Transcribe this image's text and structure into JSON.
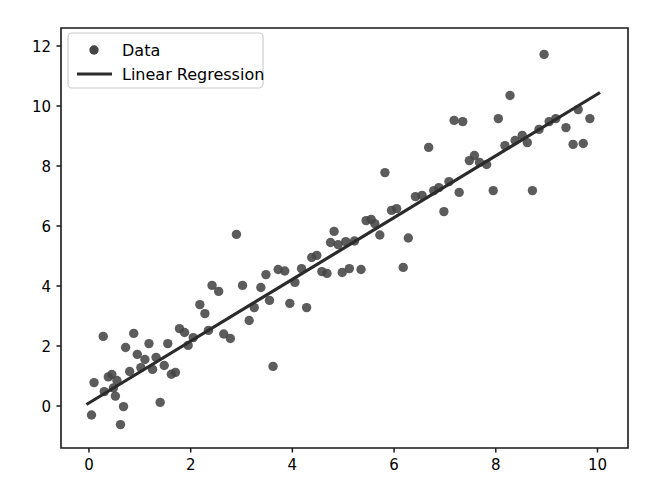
{
  "figure": {
    "width": 646,
    "height": 503,
    "background_color": "#ffffff"
  },
  "chart_data": {
    "type": "scatter",
    "title": "",
    "xlabel": "",
    "ylabel": "",
    "xlim": [
      -0.55,
      10.6
    ],
    "ylim": [
      -1.4,
      12.6
    ],
    "xticks": [
      0,
      2,
      4,
      6,
      8,
      10
    ],
    "yticks": [
      0,
      2,
      4,
      6,
      8,
      10,
      12
    ],
    "xtick_labels": [
      "0",
      "2",
      "4",
      "6",
      "8",
      "10"
    ],
    "ytick_labels": [
      "0",
      "2",
      "4",
      "6",
      "8",
      "10",
      "12"
    ],
    "grid": false,
    "legend_position": "upper left",
    "marker_color": "#454545",
    "line_color": "#2b2b2b",
    "marker_size": 9,
    "line_width": 3.2,
    "series": [
      {
        "name": "Data",
        "type": "scatter",
        "marker": "circle",
        "color": "#454545",
        "points": [
          [
            0.05,
            -0.3
          ],
          [
            0.1,
            0.78
          ],
          [
            0.28,
            2.32
          ],
          [
            0.3,
            0.48
          ],
          [
            0.38,
            0.97
          ],
          [
            0.45,
            1.05
          ],
          [
            0.48,
            0.6
          ],
          [
            0.52,
            0.33
          ],
          [
            0.55,
            0.85
          ],
          [
            0.62,
            -0.62
          ],
          [
            0.68,
            -0.02
          ],
          [
            0.72,
            1.95
          ],
          [
            0.8,
            1.15
          ],
          [
            0.88,
            2.42
          ],
          [
            0.95,
            1.72
          ],
          [
            1.02,
            1.28
          ],
          [
            1.1,
            1.55
          ],
          [
            1.18,
            2.08
          ],
          [
            1.25,
            1.22
          ],
          [
            1.32,
            1.62
          ],
          [
            1.4,
            0.12
          ],
          [
            1.48,
            1.35
          ],
          [
            1.55,
            2.08
          ],
          [
            1.62,
            1.06
          ],
          [
            1.7,
            1.12
          ],
          [
            1.78,
            2.58
          ],
          [
            1.88,
            2.45
          ],
          [
            1.95,
            2.02
          ],
          [
            2.05,
            2.28
          ],
          [
            2.18,
            3.38
          ],
          [
            2.28,
            3.08
          ],
          [
            2.35,
            2.52
          ],
          [
            2.42,
            4.02
          ],
          [
            2.55,
            3.82
          ],
          [
            2.65,
            2.4
          ],
          [
            2.78,
            2.25
          ],
          [
            2.9,
            5.72
          ],
          [
            3.02,
            4.02
          ],
          [
            3.15,
            2.85
          ],
          [
            3.25,
            3.28
          ],
          [
            3.38,
            3.95
          ],
          [
            3.48,
            4.38
          ],
          [
            3.55,
            3.52
          ],
          [
            3.62,
            1.32
          ],
          [
            3.72,
            4.55
          ],
          [
            3.85,
            4.5
          ],
          [
            3.95,
            3.42
          ],
          [
            4.05,
            4.12
          ],
          [
            4.18,
            4.58
          ],
          [
            4.28,
            3.28
          ],
          [
            4.38,
            4.95
          ],
          [
            4.48,
            5.02
          ],
          [
            4.58,
            4.48
          ],
          [
            4.68,
            4.42
          ],
          [
            4.75,
            5.45
          ],
          [
            4.82,
            5.82
          ],
          [
            4.9,
            5.38
          ],
          [
            4.98,
            4.45
          ],
          [
            5.05,
            5.48
          ],
          [
            5.12,
            4.58
          ],
          [
            5.22,
            5.5
          ],
          [
            5.35,
            4.55
          ],
          [
            5.45,
            6.18
          ],
          [
            5.55,
            6.22
          ],
          [
            5.62,
            6.08
          ],
          [
            5.72,
            5.7
          ],
          [
            5.82,
            7.78
          ],
          [
            5.95,
            6.52
          ],
          [
            6.05,
            6.58
          ],
          [
            6.18,
            4.62
          ],
          [
            6.28,
            5.6
          ],
          [
            6.42,
            6.98
          ],
          [
            6.55,
            7.02
          ],
          [
            6.68,
            8.62
          ],
          [
            6.78,
            7.18
          ],
          [
            6.88,
            7.28
          ],
          [
            6.98,
            6.48
          ],
          [
            7.08,
            7.48
          ],
          [
            7.18,
            9.52
          ],
          [
            7.28,
            7.12
          ],
          [
            7.35,
            9.48
          ],
          [
            7.48,
            8.18
          ],
          [
            7.58,
            8.35
          ],
          [
            7.68,
            8.12
          ],
          [
            7.82,
            8.05
          ],
          [
            7.95,
            7.18
          ],
          [
            8.05,
            9.58
          ],
          [
            8.18,
            8.68
          ],
          [
            8.28,
            10.35
          ],
          [
            8.38,
            8.85
          ],
          [
            8.52,
            9.02
          ],
          [
            8.62,
            8.78
          ],
          [
            8.72,
            7.18
          ],
          [
            8.85,
            9.22
          ],
          [
            8.95,
            11.72
          ],
          [
            9.05,
            9.48
          ],
          [
            9.18,
            9.58
          ],
          [
            9.38,
            9.28
          ],
          [
            9.52,
            8.72
          ],
          [
            9.62,
            9.88
          ],
          [
            9.72,
            8.75
          ],
          [
            9.85,
            9.58
          ]
        ]
      },
      {
        "name": "Linear Regression",
        "type": "line",
        "color": "#2b2b2b",
        "slope": 1.03,
        "intercept": 0.1,
        "endpoints": [
          [
            -0.05,
            0.05
          ],
          [
            10.05,
            10.45
          ]
        ]
      }
    ],
    "legend_entries": [
      {
        "label": "Data",
        "marker": "circle",
        "color": "#454545"
      },
      {
        "label": "Linear Regression",
        "marker": "line",
        "color": "#2b2b2b"
      }
    ]
  }
}
